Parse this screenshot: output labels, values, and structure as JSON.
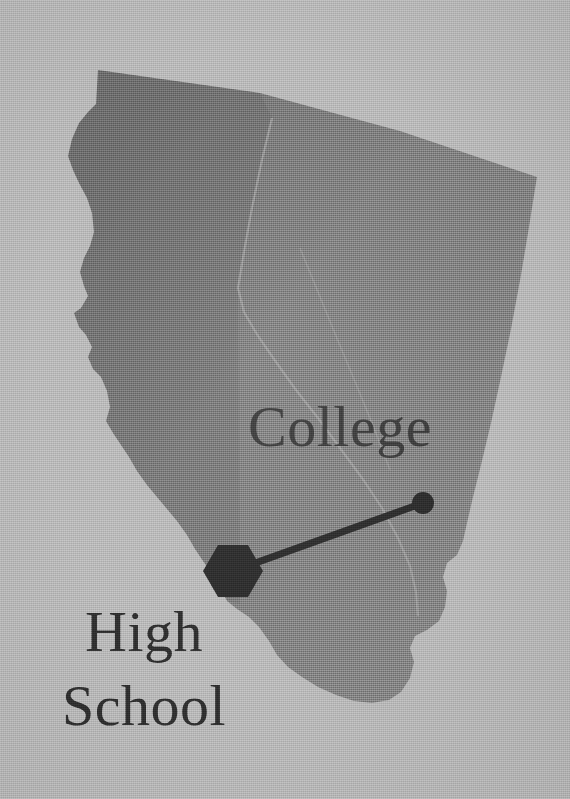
{
  "map": {
    "title": "California",
    "background_color": "#b6b6b6",
    "land_fill_color": "#7e7e7e",
    "land_fill_color_dark": "#6f6f6f",
    "boundary_line_color": "#9a9a9a",
    "marker_color": "#2b2b2b",
    "connector_color": "#2b2b2b"
  },
  "labels": {
    "college": "College",
    "high_school_line1": "High",
    "high_school_line2": "School"
  },
  "markers": [
    {
      "name": "college-marker",
      "shape": "circle",
      "label": "College",
      "x": 423,
      "y": 503,
      "radius": 11,
      "color": "#2b2b2b"
    },
    {
      "name": "high-school-marker",
      "shape": "hexagon",
      "label": "High School",
      "x": 233,
      "y": 571,
      "radius": 30,
      "color": "#2b2b2b"
    }
  ],
  "connector": {
    "name": "marker-connector-line",
    "from_x": 233,
    "from_y": 571,
    "to_x": 423,
    "to_y": 503,
    "width": 7,
    "color": "#2b2b2b"
  },
  "geometry": {
    "state_outline": "M 98,70 L 96,104 L 88,112 L 78,124 L 72,140 L 68,156 L 72,170 L 78,182 L 86,198 L 92,212 L 94,232 L 90,246 L 84,258 L 80,272 L 84,286 L 88,296 L 82,308 L 74,312 L 78,326 L 86,334 L 92,346 L 88,356 L 92,368 L 100,376 L 106,390 L 110,406 L 106,420 L 112,432 L 120,444 L 128,456 L 136,470 L 146,484 L 156,496 L 166,508 L 176,520 L 186,534 L 194,548 L 202,560 L 212,574 L 220,588 L 226,600 L 236,608 L 248,616 L 258,626 L 268,640 L 276,654 L 286,666 L 300,676 L 316,686 L 334,694 L 352,700 L 370,702 L 388,700 L 400,692 L 410,678 L 414,662 L 410,648 L 414,636 L 426,630 L 438,622 L 444,608 L 446,592 L 442,578 L 446,564 L 456,556 L 462,542 L 466,524 L 472,498 L 480,466 L 490,424 L 500,378 L 510,330 L 520,276 L 528,228 L 534,190 L 536,178 L 400,132 L 260,94 L 98,70 Z",
    "internal_boundary": "M 272,118 L 262,160 L 252,208 L 244,252 L 238,288 L 244,312 L 258,336 L 276,362 L 296,390 L 318,418 L 340,448 L 362,478 L 382,508 L 398,538 L 410,566 L 416,592 L 418,616",
    "faint_boundary_2": "M 300,248 L 318,292 L 336,336 L 356,384 L 374,428 L 390,470"
  }
}
